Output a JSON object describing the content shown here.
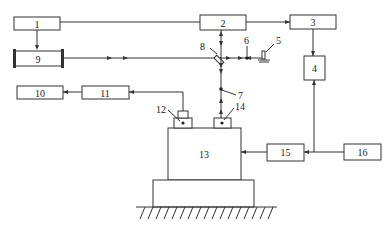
{
  "diagram": {
    "type": "block-diagram",
    "colors": {
      "stroke": "#333333",
      "background": "#ffffff"
    },
    "blocks": [
      {
        "id": "1",
        "label": "1"
      },
      {
        "id": "2",
        "label": "2"
      },
      {
        "id": "3",
        "label": "3"
      },
      {
        "id": "4",
        "label": "4"
      },
      {
        "id": "9",
        "label": "9"
      },
      {
        "id": "10",
        "label": "10"
      },
      {
        "id": "11",
        "label": "11"
      },
      {
        "id": "13",
        "label": "13"
      },
      {
        "id": "15",
        "label": "15"
      },
      {
        "id": "16",
        "label": "16"
      }
    ],
    "callouts": {
      "5": "5",
      "6": "6",
      "7": "7",
      "8": "8",
      "12": "12",
      "14": "14"
    },
    "connections": [
      {
        "from": "1",
        "to": "2"
      },
      {
        "from": "1",
        "to": "9"
      },
      {
        "from": "2",
        "to": "3"
      },
      {
        "from": "3",
        "to": "4"
      },
      {
        "from": "9",
        "to": "8"
      },
      {
        "from": "8",
        "to": "2"
      },
      {
        "from": "8",
        "to": "6"
      },
      {
        "from": "8",
        "to": "7"
      },
      {
        "from": "14",
        "to": "7"
      },
      {
        "from": "12",
        "to": "11"
      },
      {
        "from": "11",
        "to": "10"
      },
      {
        "from": "16",
        "to": "15"
      },
      {
        "from": "16",
        "to": "4"
      },
      {
        "from": "15",
        "to": "13"
      }
    ]
  }
}
